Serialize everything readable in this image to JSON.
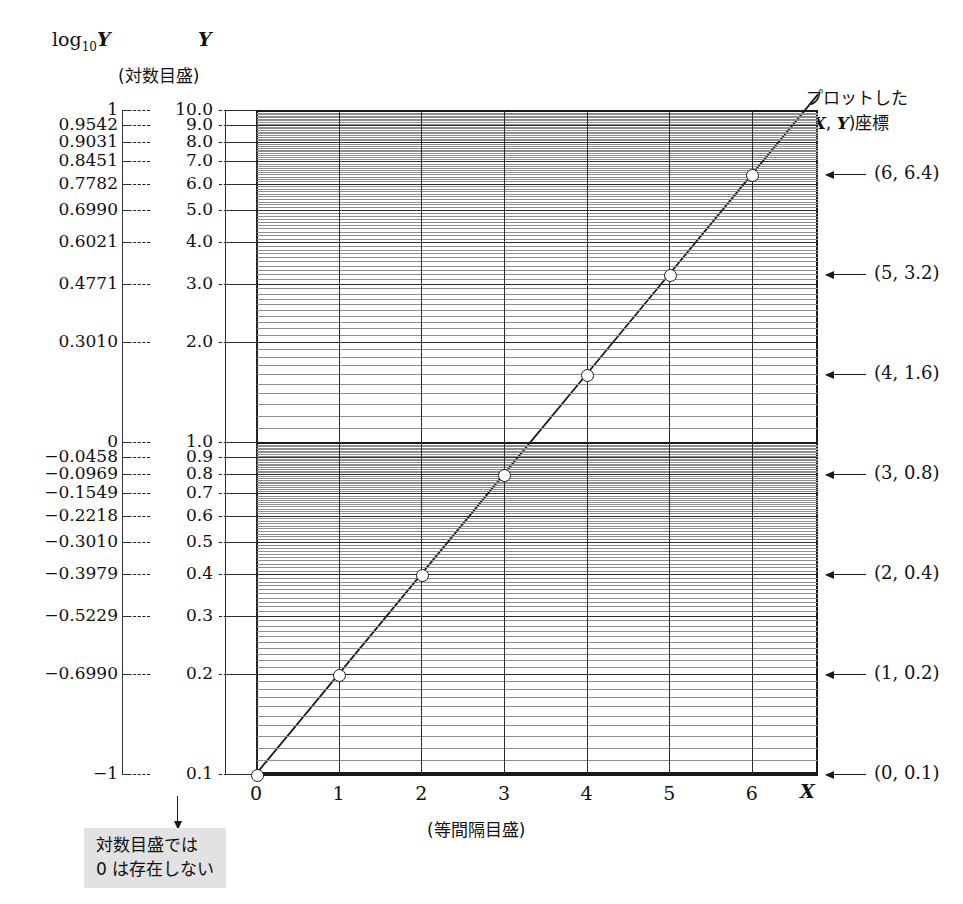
{
  "headers": {
    "log_axis_label": "log10Y",
    "log_axis_label_base": "log",
    "log_axis_label_sub": "10",
    "log_axis_label_var": "Y",
    "y_axis_label": "Y",
    "log_scale_caption": "(対数目盛)",
    "right_title_line1": "プロットした",
    "right_title_line2_pre": "(",
    "right_title_line2_x": "X",
    "right_title_line2_mid": ", ",
    "right_title_line2_y": "Y",
    "right_title_line2_post": ")座標",
    "x_axis_title": "X",
    "x_caption": "(等間隔目盛)"
  },
  "note": {
    "line1": "対数目盛では",
    "line2": "0 は存在しない"
  },
  "axis_rows": [
    {
      "log": "1",
      "y": "10.0"
    },
    {
      "log": "0.9542",
      "y": "9.0"
    },
    {
      "log": "0.9031",
      "y": "8.0"
    },
    {
      "log": "0.8451",
      "y": "7.0"
    },
    {
      "log": "0.7782",
      "y": "6.0"
    },
    {
      "log": "0.6990",
      "y": "5.0"
    },
    {
      "log": "0.6021",
      "y": "4.0"
    },
    {
      "log": "0.4771",
      "y": "3.0"
    },
    {
      "log": "0.3010",
      "y": "2.0"
    },
    {
      "log": "0",
      "y": "1.0"
    },
    {
      "log": "−0.0458",
      "y": "0.9"
    },
    {
      "log": "−0.0969",
      "y": "0.8"
    },
    {
      "log": "−0.1549",
      "y": "0.7"
    },
    {
      "log": "−0.2218",
      "y": "0.6"
    },
    {
      "log": "−0.3010",
      "y": "0.5"
    },
    {
      "log": "−0.3979",
      "y": "0.4"
    },
    {
      "log": "−0.5229",
      "y": "0.3"
    },
    {
      "log": "−0.6990",
      "y": "0.2"
    },
    {
      "log": "−1",
      "y": "0.1"
    }
  ],
  "x_ticks": [
    "0",
    "1",
    "2",
    "3",
    "4",
    "5",
    "6"
  ],
  "point_annotations": [
    {
      "label": "(6, 6.4)"
    },
    {
      "label": "(5, 3.2)"
    },
    {
      "label": "(4, 1.6)"
    },
    {
      "label": "(3, 0.8)"
    },
    {
      "label": "(2, 0.4)"
    },
    {
      "label": "(1, 0.2)"
    },
    {
      "label": "(0, 0.1)"
    }
  ],
  "colors": {
    "grid_minor": "#8e8e8e",
    "grid_major": "#2b2b2b",
    "axis": "#1a1a1a",
    "note_bg": "#e2e2e2",
    "marker_fill": "#ffffff"
  },
  "chart_data": {
    "type": "line",
    "title": "",
    "xlabel": "X",
    "ylabel": "Y",
    "x": [
      0,
      1,
      2,
      3,
      4,
      5,
      6
    ],
    "series": [
      {
        "name": "Y = 0.1 × 2^X",
        "values": [
          0.1,
          0.2,
          0.4,
          0.8,
          1.6,
          3.2,
          6.4
        ],
        "log10_values": [
          -1,
          -0.699,
          -0.3979,
          -0.0969,
          0.2041,
          0.5051,
          0.8062
        ]
      }
    ],
    "xlim": [
      0,
      6.8
    ],
    "ylim": [
      0.1,
      10.0
    ],
    "yscale": "log",
    "xscale": "linear",
    "grid": true,
    "legend": "none",
    "y_tick_labels": [
      "0.1",
      "0.2",
      "0.3",
      "0.4",
      "0.5",
      "0.6",
      "0.7",
      "0.8",
      "0.9",
      "1.0",
      "2.0",
      "3.0",
      "4.0",
      "5.0",
      "6.0",
      "7.0",
      "8.0",
      "9.0",
      "10.0"
    ],
    "y_log_tick_labels": [
      "−1",
      "−0.6990",
      "−0.5229",
      "−0.3979",
      "−0.3010",
      "−0.2218",
      "−0.1549",
      "−0.0969",
      "−0.0458",
      "0",
      "0.3010",
      "0.4771",
      "0.6021",
      "0.6990",
      "0.7782",
      "0.8451",
      "0.9031",
      "0.9542",
      "1"
    ],
    "x_tick_labels": [
      "0",
      "1",
      "2",
      "3",
      "4",
      "5",
      "6"
    ],
    "annotations": [
      "(0, 0.1)",
      "(1, 0.2)",
      "(2, 0.4)",
      "(3, 0.8)",
      "(4, 1.6)",
      "(5, 3.2)",
      "(6, 6.4)"
    ]
  }
}
